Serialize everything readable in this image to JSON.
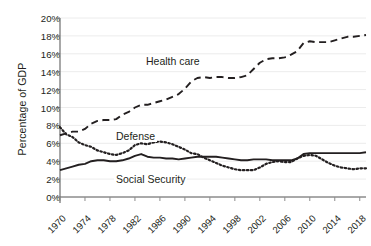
{
  "chart_data": {
    "type": "line",
    "title": "",
    "xlabel": "",
    "ylabel": "Percentage of GDP",
    "xlim": [
      1970,
      2019
    ],
    "ylim": [
      0,
      20
    ],
    "grid": "horizontal",
    "legend_position": "inline-annotations",
    "ytick_labels": [
      "20%",
      "18%",
      "16%",
      "14%",
      "12%",
      "10%",
      "8%",
      "6%",
      "4%",
      "2%",
      "0%"
    ],
    "ytick_values": [
      20,
      18,
      16,
      14,
      12,
      10,
      8,
      6,
      4,
      2,
      0
    ],
    "xtick_labels": [
      "1970",
      "1974",
      "1978",
      "1982",
      "1986",
      "1990",
      "1994",
      "1998",
      "2002",
      "2006",
      "2010",
      "2014",
      "2018"
    ],
    "xtick_values": [
      1970,
      1974,
      1978,
      1982,
      1986,
      1990,
      1994,
      1998,
      2002,
      2006,
      2010,
      2014,
      2018
    ],
    "x": [
      1970,
      1971,
      1972,
      1973,
      1974,
      1975,
      1976,
      1977,
      1978,
      1979,
      1980,
      1981,
      1982,
      1983,
      1984,
      1985,
      1986,
      1987,
      1988,
      1989,
      1990,
      1991,
      1992,
      1993,
      1994,
      1995,
      1996,
      1997,
      1998,
      1999,
      2000,
      2001,
      2002,
      2003,
      2004,
      2005,
      2006,
      2007,
      2008,
      2009,
      2010,
      2011,
      2012,
      2013,
      2014,
      2015,
      2016,
      2017,
      2018,
      2019
    ],
    "series": [
      {
        "name": "Health care",
        "style": "dashed",
        "color": "#231f20",
        "values": [
          6.9,
          7.1,
          7.3,
          7.3,
          7.6,
          8.2,
          8.5,
          8.6,
          8.6,
          8.7,
          9.2,
          9.5,
          10.0,
          10.3,
          10.3,
          10.5,
          10.7,
          10.9,
          11.2,
          11.5,
          12.1,
          12.9,
          13.3,
          13.4,
          13.3,
          13.4,
          13.4,
          13.3,
          13.3,
          13.4,
          13.6,
          14.3,
          15.0,
          15.4,
          15.5,
          15.5,
          15.6,
          15.9,
          16.3,
          17.2,
          17.4,
          17.3,
          17.3,
          17.3,
          17.5,
          17.7,
          17.9,
          17.9,
          18.0,
          18.1
        ]
      },
      {
        "name": "Defense",
        "style": "dotted",
        "color": "#231f20",
        "values": [
          7.8,
          7.0,
          6.7,
          6.1,
          5.8,
          5.6,
          5.2,
          5.0,
          4.8,
          4.7,
          4.9,
          5.2,
          5.8,
          6.0,
          5.9,
          6.1,
          6.2,
          6.1,
          5.9,
          5.6,
          5.3,
          4.9,
          4.8,
          4.4,
          4.1,
          3.8,
          3.5,
          3.3,
          3.1,
          3.0,
          3.0,
          3.0,
          3.3,
          3.7,
          3.9,
          4.0,
          3.9,
          3.9,
          4.3,
          4.6,
          4.7,
          4.6,
          4.2,
          3.8,
          3.5,
          3.3,
          3.2,
          3.1,
          3.2,
          3.2
        ]
      },
      {
        "name": "Social Security",
        "style": "solid",
        "color": "#231f20",
        "values": [
          3.0,
          3.2,
          3.4,
          3.6,
          3.7,
          4.0,
          4.1,
          4.1,
          4.0,
          4.0,
          4.1,
          4.3,
          4.6,
          4.8,
          4.5,
          4.4,
          4.4,
          4.3,
          4.3,
          4.2,
          4.3,
          4.4,
          4.5,
          4.5,
          4.5,
          4.5,
          4.4,
          4.3,
          4.2,
          4.1,
          4.1,
          4.2,
          4.2,
          4.2,
          4.1,
          4.1,
          4.1,
          4.1,
          4.3,
          4.8,
          4.9,
          4.9,
          4.9,
          4.9,
          4.9,
          4.9,
          4.9,
          4.9,
          4.9,
          5.0
        ]
      }
    ],
    "annotations": [
      {
        "text": "Health care",
        "x_px": 144,
        "y_px": 55
      },
      {
        "text": "Defense",
        "x_px": 114,
        "y_px": 130
      },
      {
        "text": "Social Security",
        "x_px": 114,
        "y_px": 173
      }
    ],
    "axis_color": "#8c8c8c",
    "grid_color": "#ececec"
  }
}
